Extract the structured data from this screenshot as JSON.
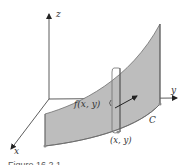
{
  "figure": {
    "axes": {
      "z_label": "z",
      "y_label": "y",
      "x_label": "x"
    },
    "labels": {
      "curve": "C",
      "height": "f(x, y)",
      "point": "(x, y)"
    },
    "caption": "Figure 16.2.1",
    "colors": {
      "surface_fill": "#bdbdbd",
      "surface_edge": "#6e6e6e",
      "axis": "#333333",
      "dot": "#8a8a8a"
    }
  }
}
